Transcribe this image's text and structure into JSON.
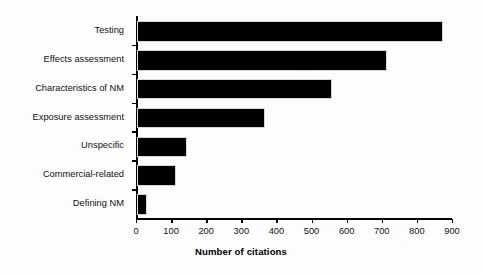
{
  "chart_data": {
    "type": "bar",
    "orientation": "horizontal",
    "title": "",
    "xlabel": "Number of citations",
    "ylabel": "",
    "categories": [
      "Testing",
      "Effects assessment",
      "Characteristics of NM",
      "Exposure assessment",
      "Unspecific",
      "Commercial-related",
      "Defining NM"
    ],
    "values": [
      866,
      706,
      551,
      360,
      137,
      106,
      23
    ],
    "xlim": [
      0,
      900
    ],
    "xticks": [
      0,
      100,
      200,
      300,
      400,
      500,
      600,
      700,
      800,
      900
    ],
    "xtick_labels": [
      "0",
      "100",
      "200",
      "300",
      "400",
      "500",
      "600",
      "700",
      "800",
      "900"
    ],
    "grid": false,
    "legend": false,
    "bar_color": "#000000",
    "background_color": "#fdfdfd",
    "axis_color": "#000000"
  }
}
